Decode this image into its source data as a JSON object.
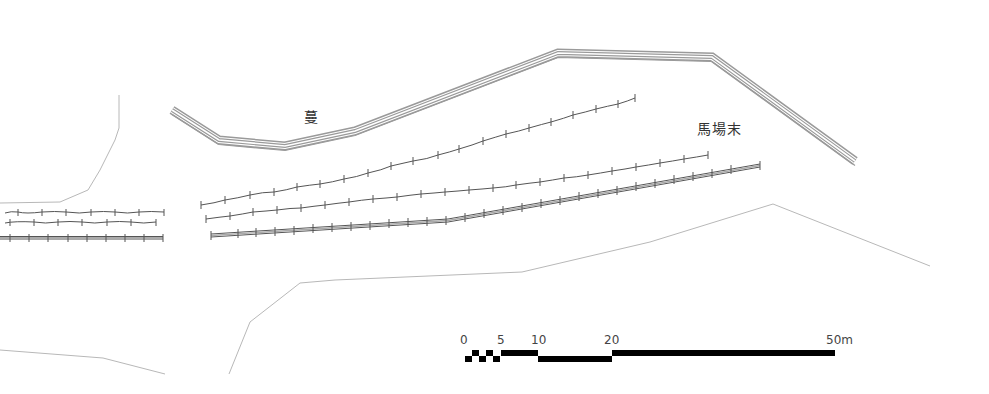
{
  "figure": {
    "type": "site-plan",
    "labels": [
      {
        "id": "area-1",
        "text": "蔓"
      },
      {
        "id": "area-2",
        "text": "馬場末"
      }
    ],
    "scale_bar": {
      "ticks": [
        "0",
        "5",
        "10",
        "20",
        "50m"
      ],
      "unit": "m"
    },
    "colors": {
      "wall": "#9a9a9a",
      "fence": "#555555",
      "boundary": "#b5b5b5",
      "scale": "#000000",
      "text": "#333333"
    }
  }
}
